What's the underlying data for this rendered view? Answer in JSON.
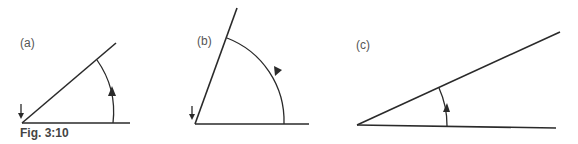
{
  "figure": {
    "caption": "Fig. 3:10",
    "panels": [
      {
        "label": "(a)",
        "description": "acute angle ~40° with counter-clockwise arc arrow; vertex marked with down arrow"
      },
      {
        "label": "(b)",
        "description": "angle ~70° with counter-clockwise arc arrow; vertex marked with down arrow"
      },
      {
        "label": "(c)",
        "description": "acute angle ~25° with counter-clockwise arc arrow"
      }
    ]
  },
  "colors": {
    "line": "#2a2a2a",
    "text": "#555555"
  }
}
